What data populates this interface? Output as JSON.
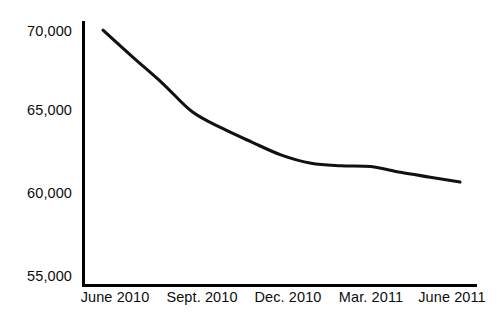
{
  "chart_data": {
    "type": "line",
    "title": "",
    "subtitle": "",
    "xlabel": "",
    "ylabel": "",
    "grid": false,
    "legend": false,
    "legend_position": "none",
    "line_color": "#111111",
    "background_color": "#ffffff",
    "axis_color": "#000000",
    "ylim": [
      55000,
      70000
    ],
    "ytick_values": [
      70000,
      65000,
      60000,
      55000
    ],
    "ytick_labels": [
      "70,000",
      "65,000",
      "60,000",
      "55,000"
    ],
    "categories": [
      "June 2010",
      "Sept. 2010",
      "Dec. 2010",
      "Mar. 2011",
      "June 2011"
    ],
    "xtick_labels": [
      "June 2010",
      "Sept. 2010",
      "Dec. 2010",
      "Mar. 2011",
      "June 2011"
    ],
    "series": [
      {
        "name": "",
        "x": [
          "June 2010",
          "July 2010",
          "Aug. 2010",
          "Sept. 2010",
          "Oct. 2010",
          "Nov. 2010",
          "Dec. 2010",
          "Jan. 2011",
          "Feb. 2011",
          "Mar. 2011",
          "Apr. 2011",
          "May 2011",
          "June 2011"
        ],
        "values": [
          70050,
          68400,
          66800,
          65050,
          64050,
          63200,
          62400,
          61900,
          61750,
          61700,
          61350,
          61050,
          60750
        ]
      }
    ],
    "annotations": []
  },
  "axes": {
    "y_axis_name": "value-axis",
    "x_axis_name": "time-axis"
  }
}
